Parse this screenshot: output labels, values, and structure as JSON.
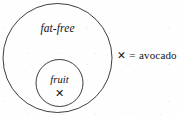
{
  "diagram": {
    "type": "euler-set-diagram",
    "background_color": "#fefefe",
    "stroke_color": "#1b1b1b",
    "text_color": "#141414",
    "sets": [
      {
        "name": "outer-set",
        "label": "fat-free",
        "shape": "circle",
        "center_x": 57.5,
        "center_y": 58,
        "radius": 54.5,
        "contains": [
          "fruit"
        ]
      },
      {
        "name": "inner-set",
        "label": "fruit",
        "shape": "circle",
        "center_x": 59.5,
        "center_y": 83,
        "radius": 23.5,
        "contains": []
      }
    ],
    "points": [
      {
        "name": "avocado-point",
        "symbol": "✕",
        "inside_set": "fruit",
        "x": 59.5,
        "y": 93
      }
    ],
    "legend": {
      "symbol": "✕",
      "equals": "=",
      "label": "avocado"
    }
  },
  "chart_data": {
    "type": "diagram",
    "title": "",
    "sets": [
      "fat-free",
      "fruit"
    ],
    "relation": "fruit ⊂ fat-free",
    "members": [
      {
        "label": "avocado",
        "symbol": "✕",
        "sets": [
          "fruit",
          "fat-free"
        ]
      }
    ]
  }
}
